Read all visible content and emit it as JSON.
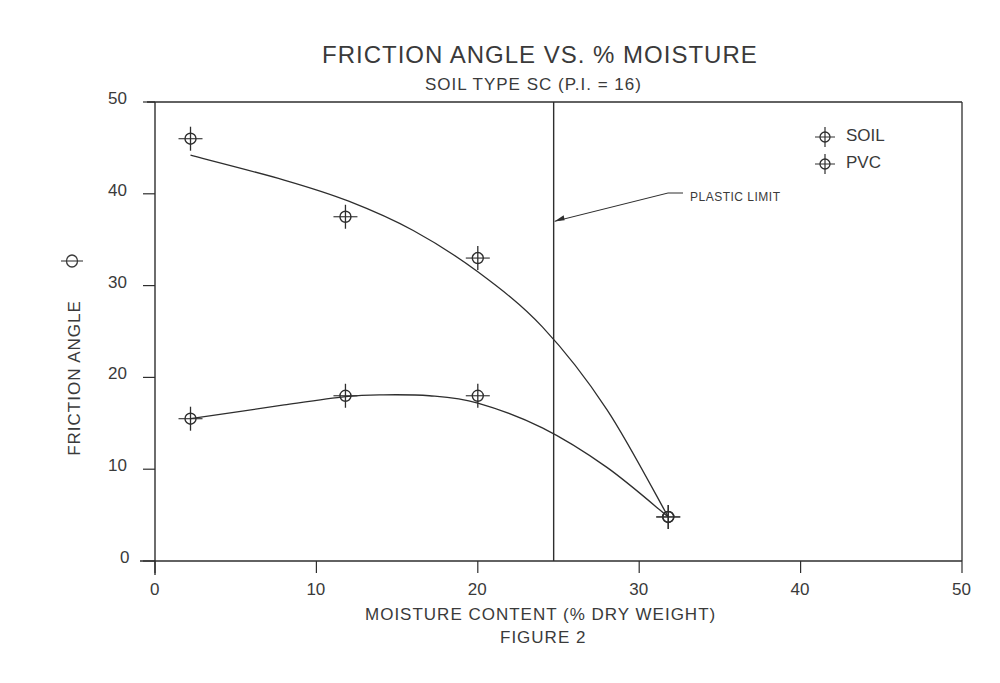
{
  "chart_data": {
    "type": "line",
    "title": "FRICTION ANGLE VS. % MOISTURE",
    "subtitle": "SOIL TYPE SC (P.I. = 16)",
    "xlabel": "MOISTURE CONTENT (% DRY WEIGHT)",
    "ylabel": "FRICTION ANGLE",
    "ylabel_symbol": "Φ",
    "caption": "FIGURE 2",
    "xlim": [
      0,
      50
    ],
    "ylim": [
      0,
      50
    ],
    "x_ticks": [
      "0",
      "10",
      "20",
      "30",
      "40",
      "50"
    ],
    "y_ticks": [
      "0",
      "10",
      "20",
      "30",
      "40",
      "50"
    ],
    "grid": false,
    "legend_position": "upper right",
    "series": [
      {
        "name": "SOIL",
        "marker": "circle-cross",
        "x": [
          2.2,
          11.8,
          20.0,
          31.8
        ],
        "y": [
          46.0,
          37.5,
          33.0,
          4.8
        ],
        "fit_curve": {
          "x": [
            2.2,
            8,
            12,
            16,
            20,
            24,
            28,
            31.8
          ],
          "y": [
            44.2,
            41.5,
            39.2,
            36.0,
            31.5,
            25.5,
            16.5,
            4.8
          ]
        }
      },
      {
        "name": "PVC",
        "marker": "circle-cross",
        "x": [
          2.2,
          11.8,
          20.0,
          31.8
        ],
        "y": [
          15.5,
          18.0,
          18.0,
          4.8
        ],
        "fit_curve": {
          "x": [
            2.2,
            8,
            11.8,
            14,
            17,
            20,
            24,
            28,
            31.8
          ],
          "y": [
            15.5,
            17.0,
            17.9,
            18.1,
            18.0,
            17.2,
            14.5,
            10.2,
            4.8
          ]
        }
      }
    ],
    "annotations": [
      {
        "text": "PLASTIC LIMIT",
        "x_line": 24.7,
        "arrow_target_y": 37.0
      }
    ]
  }
}
